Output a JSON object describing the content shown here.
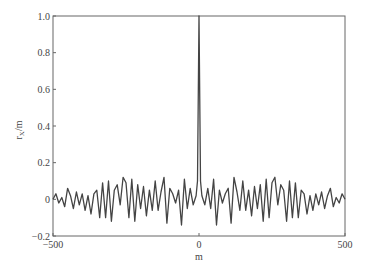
{
  "chart_data": {
    "type": "line",
    "title": "",
    "xlabel": "m",
    "ylabel": "r_X/m",
    "ylabel_main": "r",
    "ylabel_sub": "X",
    "ylabel_suffix": "/m",
    "xlim": [
      -500,
      500
    ],
    "ylim": [
      -0.2,
      1.0
    ],
    "grid": false,
    "legend": null,
    "xticks": [
      -500,
      0,
      500
    ],
    "xtick_labels": [
      "−500",
      "0",
      "500"
    ],
    "yticks": [
      -0.2,
      0,
      0.2,
      0.4,
      0.6,
      0.8,
      1.0
    ],
    "ytick_labels": [
      "−0.2",
      "0",
      "0.2",
      "0.4",
      "0.6",
      "0.8",
      "1.0"
    ],
    "series": [
      {
        "name": "autocorrelation",
        "color": "#444444",
        "x": [
          -500,
          -490,
          -480,
          -470,
          -460,
          -450,
          -440,
          -430,
          -420,
          -410,
          -400,
          -390,
          -380,
          -370,
          -360,
          -350,
          -340,
          -330,
          -320,
          -310,
          -300,
          -290,
          -280,
          -270,
          -260,
          -250,
          -240,
          -230,
          -220,
          -210,
          -200,
          -190,
          -180,
          -170,
          -160,
          -150,
          -140,
          -130,
          -120,
          -110,
          -100,
          -90,
          -80,
          -70,
          -60,
          -50,
          -40,
          -30,
          -20,
          -10,
          -5,
          0,
          5,
          10,
          20,
          30,
          40,
          50,
          60,
          70,
          80,
          90,
          100,
          110,
          120,
          130,
          140,
          150,
          160,
          170,
          180,
          190,
          200,
          210,
          220,
          230,
          240,
          250,
          260,
          270,
          280,
          290,
          300,
          310,
          320,
          330,
          340,
          350,
          360,
          370,
          380,
          390,
          400,
          410,
          420,
          430,
          440,
          450,
          460,
          470,
          480,
          490,
          500
        ],
        "values": [
          0.0,
          0.03,
          -0.02,
          0.01,
          -0.04,
          0.06,
          0.02,
          -0.05,
          0.04,
          -0.03,
          0.03,
          -0.06,
          0.02,
          -0.08,
          0.03,
          0.05,
          -0.1,
          0.09,
          -0.1,
          0.1,
          -0.12,
          0.05,
          0.08,
          -0.03,
          0.12,
          0.09,
          -0.1,
          0.11,
          -0.12,
          0.08,
          -0.05,
          0.07,
          -0.09,
          0.05,
          -0.06,
          0.1,
          -0.06,
          0.04,
          0.12,
          -0.13,
          0.06,
          0.03,
          -0.02,
          0.05,
          -0.14,
          0.11,
          -0.05,
          0.06,
          -0.03,
          0.02,
          0.1,
          1.0,
          0.1,
          0.02,
          -0.03,
          0.06,
          -0.05,
          0.11,
          -0.14,
          0.05,
          -0.02,
          0.03,
          0.06,
          -0.13,
          0.12,
          0.04,
          -0.06,
          0.1,
          -0.06,
          0.05,
          -0.09,
          0.07,
          -0.05,
          0.08,
          -0.12,
          0.11,
          -0.1,
          0.09,
          0.12,
          -0.03,
          0.08,
          0.05,
          -0.12,
          0.1,
          -0.1,
          0.09,
          -0.1,
          0.05,
          0.03,
          -0.08,
          0.02,
          -0.06,
          0.03,
          -0.03,
          0.04,
          -0.05,
          0.02,
          0.06,
          -0.04,
          0.01,
          -0.02,
          0.03,
          0.0
        ]
      }
    ]
  }
}
